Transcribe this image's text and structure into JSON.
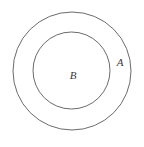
{
  "figure": {
    "kind": "set-diagram",
    "background_color": "#ffffff",
    "stroke_color": "#6b6b6b",
    "label_color": "#3a3a3a",
    "width": 144,
    "height": 147
  },
  "shapes": {
    "outer_circle": {
      "name": "A",
      "cx": 72,
      "cy": 71,
      "r": 59
    },
    "inner_circle": {
      "name": "B",
      "cx": 71.5,
      "cy": 70.5,
      "r": 38.5
    }
  },
  "labels": {
    "outer": {
      "text": "A",
      "x": 120,
      "y": 66
    },
    "inner": {
      "text": "B",
      "x": 73,
      "y": 79
    }
  }
}
